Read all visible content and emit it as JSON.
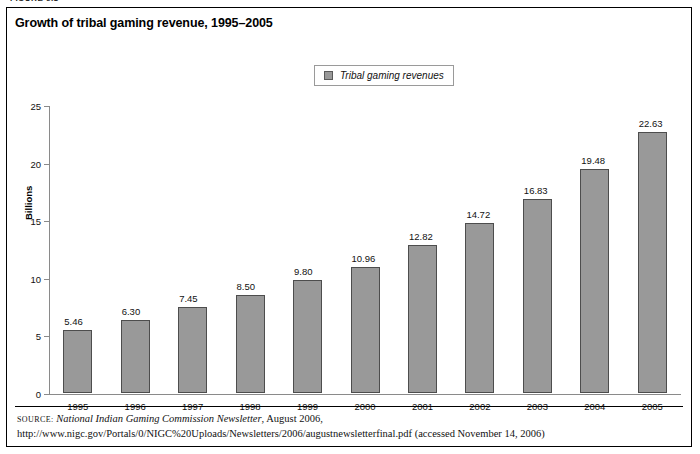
{
  "figure": {
    "caption": "FIGURE 6.1"
  },
  "chart_title": "Growth of tribal gaming revenue, 1995–2005",
  "legend": {
    "position": "top-center",
    "entries": [
      {
        "label": "Tribal gaming revenues",
        "color": "#999999"
      }
    ]
  },
  "source": {
    "prefix": "Source:",
    "italic_part": "National Indian Gaming Commission Newsletter",
    "rest": ", August 2006, http://www.nigc.gov/Portals/0/NIGC%20Uploads/Newsletters/2006/augustnewsletterfinal.pdf (accessed November 14, 2006)"
  },
  "colors": {
    "bar_fill": "#999999",
    "bar_stroke": "#4d4d4d",
    "axis": "#8a8a8a",
    "frame": "#000000"
  },
  "chart_data": {
    "type": "bar",
    "title": "Growth of tribal gaming revenue, 1995–2005",
    "xlabel": "",
    "ylabel": "Billions",
    "ylim": [
      0,
      25
    ],
    "yticks": [
      0,
      5,
      10,
      15,
      20,
      25
    ],
    "grid": false,
    "legend_position": "top-center",
    "categories": [
      "1995",
      "1996",
      "1997",
      "1998",
      "1999",
      "2000",
      "2001",
      "2002",
      "2003",
      "2004",
      "2005"
    ],
    "series": [
      {
        "name": "Tribal gaming revenues",
        "values": [
          5.46,
          6.3,
          7.45,
          8.5,
          9.8,
          10.96,
          12.82,
          14.72,
          16.83,
          19.48,
          22.63
        ],
        "labels": [
          "5.46",
          "6.30",
          "7.45",
          "8.50",
          "9.80",
          "10.96",
          "12.82",
          "14.72",
          "16.83",
          "19.48",
          "22.63"
        ],
        "color": "#999999"
      }
    ]
  }
}
